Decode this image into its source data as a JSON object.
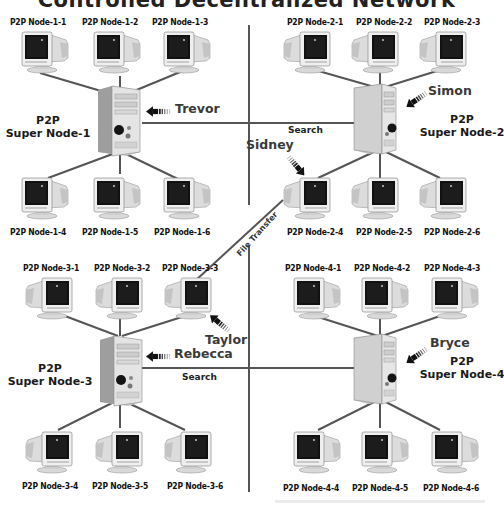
{
  "title": "Controlled Decentralized Network",
  "colors": {
    "line": "#555555",
    "text": "#111111",
    "user_text": "#3a3a3a"
  },
  "groups": [
    {
      "id": 1,
      "super_node": {
        "line1": "P2P",
        "line2": "Super Node-1",
        "user": "Trevor"
      },
      "nodes": [
        "P2P Node-1-1",
        "P2P Node-1-2",
        "P2P Node-1-3",
        "P2P Node-1-4",
        "P2P Node-1-5",
        "P2P Node-1-6"
      ]
    },
    {
      "id": 2,
      "super_node": {
        "line1": "P2P",
        "line2": "Super Node-2",
        "user": "Simon"
      },
      "nodes": [
        "P2P Node-2-1",
        "P2P Node-2-2",
        "P2P Node-2-3",
        "P2P Node-2-4",
        "P2P Node-2-5",
        "P2P Node-2-6"
      ],
      "node_user": {
        "node": "P2P Node-2-4",
        "user": "Sidney"
      }
    },
    {
      "id": 3,
      "super_node": {
        "line1": "P2P",
        "line2": "Super Node-3",
        "user": "Rebecca"
      },
      "nodes": [
        "P2P Node-3-1",
        "P2P Node-3-2",
        "P2P Node-3-3",
        "P2P Node-3-4",
        "P2P Node-3-5",
        "P2P Node-3-6"
      ],
      "node_user": {
        "node": "P2P Node-3-3",
        "user": "Taylor"
      }
    },
    {
      "id": 4,
      "super_node": {
        "line1": "P2P",
        "line2": "Super Node-4",
        "user": "Bryce"
      },
      "nodes": [
        "P2P Node-4-1",
        "P2P Node-4-2",
        "P2P Node-4-3",
        "P2P Node-4-4",
        "P2P Node-4-5",
        "P2P Node-4-6"
      ]
    }
  ],
  "links": {
    "search_top": "Search",
    "search_bottom": "Search",
    "file_transfer": "File Transfer"
  },
  "icons": {
    "node": "crt-monitor-icon",
    "super_node": "server-tower-icon",
    "user_pointer": "striped-arrow-icon"
  }
}
